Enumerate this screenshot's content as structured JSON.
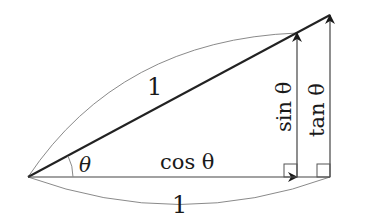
{
  "diagram": {
    "labels": {
      "hypotenuse": "1",
      "angle": "θ",
      "adjacent": "cos θ",
      "base": "1",
      "opposite": "sin θ",
      "tangent": "tan θ"
    },
    "colors": {
      "main_line": "#222222",
      "arc": "#8a8a8a",
      "vector": "#444444"
    }
  }
}
